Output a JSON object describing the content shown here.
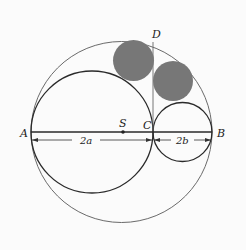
{
  "figure": {
    "labels": {
      "A": "A",
      "B": "B",
      "C": "C",
      "D": "D",
      "S": "S"
    },
    "dimensions": {
      "left": "2a",
      "right": "2b"
    },
    "colors": {
      "stroke": "#333333",
      "outer_stroke": "#666666",
      "filled_circle": "#777777",
      "background": "#fbfbfb"
    }
  }
}
